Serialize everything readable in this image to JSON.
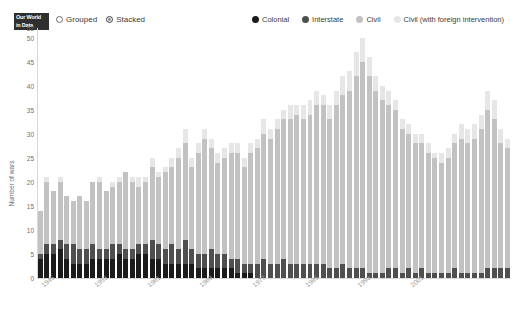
{
  "logo": {
    "line1": "Our World",
    "line2": "in Data"
  },
  "controls": {
    "options": [
      {
        "label": "Grouped",
        "selected": false
      },
      {
        "label": "Stacked",
        "selected": true
      }
    ]
  },
  "colors": {
    "colonial": "#1b1b1b",
    "interstate": "#4f4f4f",
    "civil": "#c2c2c2",
    "civil_foreign": "#e6e6e6",
    "axis": "#d8d8d8",
    "tick_text": "#6e6e6e",
    "xtick_text": "#9a9a9a"
  },
  "chart_data": {
    "type": "bar",
    "stacked": true,
    "title": "",
    "xlabel": "",
    "ylabel": "Number of wars",
    "ylim": [
      0,
      52
    ],
    "yticks": [
      0,
      5,
      10,
      15,
      20,
      25,
      30,
      35,
      40,
      45,
      50,
      52
    ],
    "grid": false,
    "legend_position": "top-right",
    "legend": [
      {
        "name": "Colonial",
        "color": "#1b1b1b"
      },
      {
        "name": "Interstate",
        "color": "#4f4f4f"
      },
      {
        "name": "Civil",
        "color": "#c2c2c2"
      },
      {
        "name": "Civil (with foreign intervention)",
        "color": "#e6e6e6"
      }
    ],
    "xticks": [
      "1945",
      "1953",
      "1961",
      "1969",
      "1977",
      "1985",
      "1993",
      "2001"
    ],
    "xtick_index": [
      0,
      8,
      16,
      24,
      32,
      40,
      48,
      56
    ],
    "categories": [
      "1945",
      "1946",
      "1947",
      "1948",
      "1949",
      "1950",
      "1951",
      "1952",
      "1953",
      "1954",
      "1955",
      "1956",
      "1957",
      "1958",
      "1959",
      "1960",
      "1961",
      "1962",
      "1963",
      "1964",
      "1965",
      "1966",
      "1967",
      "1968",
      "1969",
      "1970",
      "1971",
      "1972",
      "1973",
      "1974",
      "1975",
      "1976",
      "1977",
      "1978",
      "1979",
      "1980",
      "1981",
      "1982",
      "1983",
      "1984",
      "1985",
      "1986",
      "1987",
      "1988",
      "1989",
      "1990",
      "1991",
      "1992",
      "1993",
      "1994",
      "1995",
      "1996",
      "1997",
      "1998",
      "1999",
      "2000",
      "2001",
      "2002",
      "2003",
      "2004",
      "2005",
      "2006",
      "2007",
      "2008",
      "2009",
      "2010",
      "2011",
      "2012",
      "2013",
      "2014",
      "2015",
      "2016"
    ],
    "series": [
      {
        "name": "Colonial",
        "color": "#1b1b1b",
        "values": [
          4,
          5,
          5,
          6,
          4,
          3,
          3,
          3,
          4,
          4,
          4,
          4,
          5,
          4,
          4,
          5,
          5,
          4,
          4,
          3,
          3,
          3,
          3,
          3,
          2,
          2,
          2,
          2,
          2,
          2,
          1,
          1,
          1,
          0,
          0,
          0,
          0,
          0,
          0,
          0,
          0,
          0,
          0,
          0,
          0,
          0,
          0,
          0,
          0,
          0,
          0,
          0,
          0,
          0,
          0,
          0,
          0,
          0,
          0,
          0,
          0,
          0,
          0,
          0,
          0,
          0,
          0,
          0,
          0,
          0,
          0,
          0
        ]
      },
      {
        "name": "Interstate",
        "color": "#4f4f4f",
        "values": [
          1,
          2,
          2,
          2,
          3,
          4,
          3,
          3,
          3,
          2,
          2,
          3,
          2,
          2,
          2,
          2,
          2,
          4,
          3,
          3,
          4,
          3,
          5,
          3,
          3,
          3,
          4,
          3,
          3,
          2,
          3,
          2,
          2,
          3,
          4,
          3,
          3,
          4,
          3,
          3,
          3,
          3,
          3,
          3,
          2,
          2,
          3,
          2,
          2,
          2,
          1,
          1,
          1,
          2,
          2,
          1,
          2,
          1,
          2,
          1,
          1,
          1,
          1,
          2,
          1,
          1,
          1,
          1,
          2,
          2,
          2,
          2
        ]
      },
      {
        "name": "Civil",
        "color": "#c2c2c2",
        "values": [
          9,
          13,
          11,
          12,
          10,
          9,
          11,
          10,
          13,
          14,
          12,
          12,
          13,
          16,
          14,
          12,
          13,
          15,
          14,
          16,
          16,
          19,
          20,
          17,
          21,
          24,
          21,
          19,
          20,
          22,
          22,
          20,
          23,
          24,
          26,
          26,
          28,
          29,
          30,
          31,
          30,
          31,
          33,
          33,
          31,
          34,
          35,
          37,
          40,
          43,
          41,
          38,
          36,
          34,
          33,
          30,
          28,
          27,
          26,
          25,
          24,
          23,
          24,
          26,
          28,
          27,
          28,
          30,
          33,
          31,
          26,
          25
        ]
      },
      {
        "name": "Civil (with foreign intervention)",
        "color": "#e6e6e6",
        "values": [
          0,
          1,
          0,
          1,
          0,
          0,
          0,
          0,
          0,
          1,
          0,
          1,
          1,
          0,
          1,
          2,
          1,
          2,
          1,
          1,
          2,
          2,
          3,
          2,
          2,
          2,
          2,
          2,
          2,
          2,
          2,
          2,
          2,
          2,
          3,
          2,
          2,
          2,
          3,
          2,
          3,
          3,
          3,
          2,
          3,
          3,
          4,
          4,
          5,
          5,
          4,
          3,
          3,
          3,
          2,
          2,
          2,
          2,
          2,
          2,
          1,
          2,
          2,
          2,
          3,
          3,
          3,
          3,
          4,
          4,
          3,
          2
        ]
      }
    ]
  }
}
